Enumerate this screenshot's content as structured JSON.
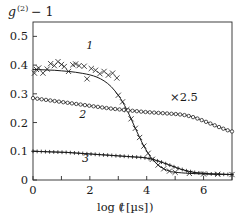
{
  "figure": {
    "ylabel": "g(2) − 1",
    "ylabel_base": "g",
    "ylabel_sup": "(2)",
    "ylabel_tail": "− 1",
    "xlabel_main": "log (",
    "xlabel_var": "t",
    "xlabel_unit": "[µs]",
    "xlabel_close": ")",
    "annotation": "×2.5",
    "background": "#ffffff",
    "ink": "#1a1a1a"
  },
  "axes": {
    "x_ticks": [
      0,
      1,
      2,
      3,
      4,
      5,
      6,
      7
    ],
    "x_tick_labels": [
      "0",
      "",
      "2",
      "",
      "4",
      "",
      "6",
      ""
    ],
    "y_ticks": [
      0,
      0.1,
      0.2,
      0.3,
      0.4,
      0.5
    ],
    "y_tick_labels": [
      "0",
      "0.1",
      "0.2",
      "0.3",
      "0.4",
      "0.5"
    ],
    "xlim": [
      0,
      7
    ],
    "ylim": [
      0,
      0.55
    ],
    "frame_px": {
      "left": 33,
      "top": 22,
      "right": 232,
      "bottom": 180
    }
  },
  "curve_labels": [
    {
      "text": "1",
      "x": 2.0,
      "y": 0.455
    },
    {
      "text": "2",
      "x": 1.75,
      "y": 0.215
    },
    {
      "text": "3",
      "x": 1.85,
      "y": 0.063
    }
  ],
  "chart_data": {
    "type": "line",
    "xlabel": "log (t [µs])",
    "ylabel": "g(2) − 1",
    "xlim": [
      0,
      7
    ],
    "ylim": [
      0,
      0.55
    ],
    "grid": false,
    "legend": "inline-curve-numbers",
    "annotations": [
      {
        "text": "×2.5",
        "x": 5.3,
        "y": 0.285
      }
    ],
    "series": [
      {
        "name": "1",
        "marker": "cross",
        "x": [
          0.0,
          0.25,
          0.5,
          0.75,
          1.0,
          1.25,
          1.5,
          1.75,
          2.0,
          2.25,
          2.5,
          2.75,
          3.0,
          3.15,
          3.3,
          3.45,
          3.6,
          3.75,
          3.9,
          4.05,
          4.2,
          4.4,
          4.6,
          4.8,
          5.0,
          5.5,
          6.0,
          6.5,
          7.0
        ],
        "y": [
          0.385,
          0.384,
          0.383,
          0.382,
          0.38,
          0.378,
          0.375,
          0.371,
          0.366,
          0.358,
          0.345,
          0.325,
          0.295,
          0.272,
          0.245,
          0.213,
          0.18,
          0.148,
          0.118,
          0.093,
          0.072,
          0.052,
          0.039,
          0.031,
          0.027,
          0.023,
          0.021,
          0.02,
          0.019
        ],
        "scatter_x": [
          0.05,
          0.12,
          0.2,
          0.35,
          0.5,
          0.62,
          0.75,
          0.88,
          1.0,
          1.1,
          1.25,
          1.4,
          1.5,
          1.62,
          1.8,
          1.9,
          2.05,
          2.2,
          2.35,
          2.5,
          2.65,
          2.8,
          2.95
        ],
        "scatter_y": [
          0.372,
          0.385,
          0.39,
          0.372,
          0.386,
          0.405,
          0.398,
          0.412,
          0.402,
          0.395,
          0.378,
          0.401,
          0.404,
          0.398,
          0.396,
          0.352,
          0.388,
          0.382,
          0.37,
          0.378,
          0.365,
          0.372,
          0.355
        ]
      },
      {
        "name": "2",
        "marker": "open-circle",
        "x": [
          0.0,
          0.3,
          0.6,
          0.9,
          1.2,
          1.5,
          1.8,
          2.1,
          2.4,
          2.7,
          3.0,
          3.3,
          3.6,
          3.9,
          4.2,
          4.5,
          4.8,
          5.1,
          5.4,
          5.7,
          6.0,
          6.3,
          6.6,
          6.85,
          7.0
        ],
        "y": [
          0.285,
          0.281,
          0.277,
          0.273,
          0.269,
          0.265,
          0.261,
          0.257,
          0.253,
          0.249,
          0.246,
          0.243,
          0.24,
          0.237,
          0.235,
          0.233,
          0.231,
          0.229,
          0.225,
          0.217,
          0.206,
          0.194,
          0.182,
          0.173,
          0.169
        ]
      },
      {
        "name": "3",
        "marker": "plus",
        "x": [
          0.0,
          0.3,
          0.6,
          0.9,
          1.2,
          1.5,
          1.8,
          2.1,
          2.4,
          2.7,
          3.0,
          3.3,
          3.6,
          3.9,
          4.2,
          4.5,
          4.8,
          5.1,
          5.4,
          5.7,
          6.0,
          6.3,
          6.6,
          7.0
        ],
        "y": [
          0.1,
          0.099,
          0.098,
          0.097,
          0.096,
          0.094,
          0.092,
          0.09,
          0.088,
          0.086,
          0.084,
          0.082,
          0.08,
          0.078,
          0.072,
          0.063,
          0.052,
          0.041,
          0.032,
          0.026,
          0.023,
          0.021,
          0.02,
          0.019
        ]
      }
    ]
  }
}
